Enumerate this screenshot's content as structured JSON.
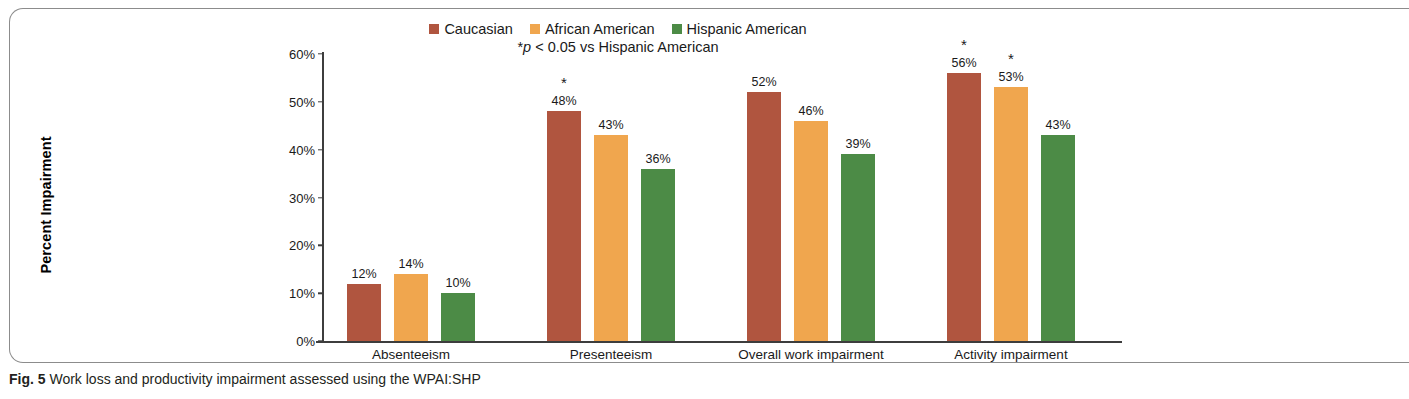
{
  "figure": {
    "caption_prefix": "Fig. 5",
    "caption_text": " Work loss and productivity impairment assessed using the WPAI:SHP"
  },
  "chart_data": {
    "type": "bar",
    "title": "",
    "subtitle": "*p < 0.05 vs Hispanic American",
    "subtitle_star": "*",
    "subtitle_italic": "p",
    "subtitle_rest": " < 0.05 vs Hispanic American",
    "xlabel": "",
    "ylabel": "Percent Impairment",
    "ylim": [
      0,
      60
    ],
    "ytick_labels": [
      "0%",
      "10%",
      "20%",
      "30%",
      "40%",
      "50%",
      "60%"
    ],
    "ytick_values": [
      0,
      10,
      20,
      30,
      40,
      50,
      60
    ],
    "grid": false,
    "legend_position": "top-center",
    "categories": [
      "Absenteeism",
      "Presenteeism",
      "Overall work impairment",
      "Activity impairment"
    ],
    "series": [
      {
        "name": "Caucasian",
        "color": "#b0553f",
        "values": [
          12,
          48,
          52,
          56
        ],
        "labels": [
          "12%",
          "48%",
          "52%",
          "56%"
        ],
        "significance": [
          "",
          "*",
          "",
          "*"
        ]
      },
      {
        "name": "African American",
        "color": "#f0a64e",
        "values": [
          14,
          43,
          46,
          53
        ],
        "labels": [
          "14%",
          "43%",
          "46%",
          "53%"
        ],
        "significance": [
          "",
          "",
          "",
          "*"
        ]
      },
      {
        "name": "Hispanic American",
        "color": "#4c8b46",
        "values": [
          10,
          36,
          39,
          43
        ],
        "labels": [
          "10%",
          "36%",
          "39%",
          "43%"
        ],
        "significance": [
          "",
          "",
          "",
          ""
        ]
      }
    ]
  }
}
